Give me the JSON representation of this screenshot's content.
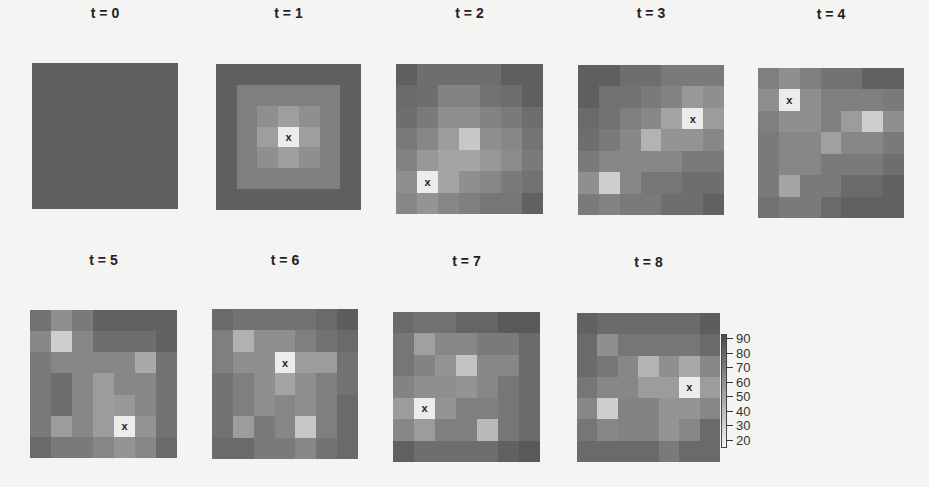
{
  "chart_data": {
    "type": "heatmap",
    "title": "",
    "xlabel": "",
    "ylabel": "",
    "grid_size": [
      7,
      7
    ],
    "marker": "x",
    "colorbar": {
      "ticks": [
        90,
        80,
        70,
        60,
        50,
        40,
        30,
        20
      ],
      "range": [
        15,
        95
      ],
      "low_color": "#f2f2f2",
      "high_color": "#4a4a4a"
    },
    "panels": [
      {
        "title": "t = 0",
        "x_pos": null,
        "values": [
          [
            85,
            85,
            85,
            85,
            85,
            85,
            85
          ],
          [
            85,
            85,
            85,
            85,
            85,
            85,
            85
          ],
          [
            85,
            85,
            85,
            85,
            85,
            85,
            85
          ],
          [
            85,
            85,
            85,
            85,
            85,
            85,
            85
          ],
          [
            85,
            85,
            85,
            85,
            85,
            85,
            85
          ],
          [
            85,
            85,
            85,
            85,
            85,
            85,
            85
          ],
          [
            85,
            85,
            85,
            85,
            85,
            85,
            85
          ]
        ]
      },
      {
        "title": "t = 1",
        "x_pos": [
          3,
          3
        ],
        "values": [
          [
            85,
            85,
            85,
            85,
            85,
            85,
            85
          ],
          [
            85,
            70,
            70,
            70,
            70,
            70,
            85
          ],
          [
            85,
            70,
            62,
            55,
            62,
            70,
            85
          ],
          [
            85,
            70,
            55,
            18,
            55,
            70,
            85
          ],
          [
            85,
            70,
            62,
            55,
            62,
            70,
            85
          ],
          [
            85,
            70,
            70,
            70,
            70,
            70,
            85
          ],
          [
            85,
            85,
            85,
            85,
            85,
            85,
            85
          ]
        ]
      },
      {
        "title": "t = 2",
        "x_pos": [
          5,
          1
        ],
        "values": [
          [
            85,
            78,
            78,
            78,
            78,
            85,
            85
          ],
          [
            80,
            78,
            68,
            68,
            76,
            78,
            85
          ],
          [
            78,
            72,
            62,
            62,
            68,
            72,
            78
          ],
          [
            72,
            66,
            56,
            35,
            62,
            66,
            75
          ],
          [
            68,
            58,
            52,
            52,
            58,
            64,
            72
          ],
          [
            62,
            18,
            52,
            62,
            66,
            72,
            76
          ],
          [
            66,
            60,
            66,
            70,
            74,
            74,
            84
          ]
        ]
      },
      {
        "title": "t = 3",
        "x_pos": [
          2,
          5
        ],
        "values": [
          [
            85,
            85,
            78,
            78,
            72,
            72,
            72
          ],
          [
            85,
            76,
            76,
            72,
            68,
            58,
            62
          ],
          [
            80,
            76,
            70,
            66,
            52,
            18,
            56
          ],
          [
            78,
            72,
            66,
            45,
            60,
            60,
            66
          ],
          [
            72,
            66,
            66,
            66,
            66,
            72,
            72
          ],
          [
            62,
            32,
            66,
            74,
            74,
            78,
            78
          ],
          [
            72,
            68,
            72,
            72,
            78,
            78,
            84
          ]
        ]
      },
      {
        "title": "t = 4",
        "x_pos": [
          1,
          1
        ],
        "values": [
          [
            70,
            62,
            70,
            76,
            76,
            84,
            84
          ],
          [
            62,
            18,
            62,
            70,
            70,
            70,
            72
          ],
          [
            70,
            62,
            62,
            70,
            56,
            32,
            62
          ],
          [
            72,
            66,
            66,
            54,
            66,
            66,
            72
          ],
          [
            72,
            66,
            66,
            72,
            72,
            72,
            78
          ],
          [
            72,
            52,
            72,
            72,
            80,
            80,
            84
          ],
          [
            76,
            72,
            72,
            80,
            84,
            84,
            84
          ]
        ]
      },
      {
        "title": "t = 5",
        "x_pos": [
          5,
          4
        ],
        "values": [
          [
            76,
            62,
            72,
            84,
            84,
            84,
            84
          ],
          [
            66,
            32,
            66,
            78,
            78,
            78,
            84
          ],
          [
            72,
            66,
            66,
            66,
            66,
            50,
            76
          ],
          [
            72,
            78,
            66,
            56,
            66,
            66,
            76
          ],
          [
            72,
            78,
            66,
            56,
            58,
            66,
            76
          ],
          [
            72,
            56,
            66,
            56,
            18,
            60,
            76
          ],
          [
            80,
            72,
            72,
            66,
            60,
            66,
            80
          ]
        ]
      },
      {
        "title": "t = 6",
        "x_pos": [
          2,
          3
        ],
        "values": [
          [
            80,
            76,
            76,
            76,
            76,
            80,
            86
          ],
          [
            70,
            46,
            62,
            62,
            70,
            76,
            80
          ],
          [
            70,
            62,
            62,
            18,
            56,
            56,
            76
          ],
          [
            76,
            70,
            62,
            52,
            62,
            70,
            76
          ],
          [
            76,
            70,
            62,
            66,
            62,
            70,
            80
          ],
          [
            76,
            56,
            72,
            66,
            36,
            70,
            80
          ],
          [
            80,
            80,
            72,
            72,
            66,
            76,
            80
          ]
        ]
      },
      {
        "title": "t = 7",
        "x_pos": [
          4,
          1
        ],
        "values": [
          [
            80,
            76,
            76,
            82,
            82,
            88,
            88
          ],
          [
            74,
            54,
            66,
            66,
            72,
            72,
            80
          ],
          [
            74,
            68,
            60,
            38,
            66,
            66,
            80
          ],
          [
            68,
            62,
            62,
            60,
            66,
            74,
            80
          ],
          [
            56,
            18,
            60,
            70,
            70,
            74,
            80
          ],
          [
            66,
            56,
            70,
            70,
            42,
            74,
            80
          ],
          [
            84,
            78,
            78,
            78,
            78,
            84,
            88
          ]
        ]
      },
      {
        "title": "t = 8",
        "x_pos": [
          3,
          5
        ],
        "values": [
          [
            84,
            80,
            80,
            80,
            80,
            80,
            86
          ],
          [
            80,
            62,
            74,
            74,
            74,
            74,
            80
          ],
          [
            80,
            74,
            66,
            45,
            62,
            50,
            66
          ],
          [
            74,
            66,
            66,
            56,
            56,
            18,
            56
          ],
          [
            66,
            32,
            68,
            68,
            60,
            60,
            66
          ],
          [
            74,
            66,
            68,
            68,
            60,
            66,
            80
          ],
          [
            80,
            80,
            80,
            80,
            72,
            80,
            80
          ]
        ]
      }
    ]
  },
  "panel_titles": [
    "t = 0",
    "t = 1",
    "t = 2",
    "t = 3",
    "t = 4",
    "t = 5",
    "t = 6",
    "t = 7",
    "t = 8"
  ],
  "colorbar_labels": [
    "90",
    "80",
    "70",
    "60",
    "50",
    "40",
    "30",
    "20"
  ],
  "marker_label": "x"
}
